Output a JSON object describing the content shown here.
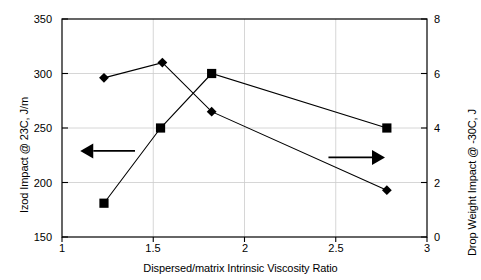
{
  "chart_data": {
    "type": "line",
    "title": "",
    "xlabel": "Dispersed/matrix Intrinsic Viscosity Ratio",
    "xlim": [
      1,
      3
    ],
    "xticks": [
      1,
      1.5,
      2,
      2.5,
      3
    ],
    "xtick_labels": [
      "1",
      "1.5",
      "2",
      "2.5",
      "3"
    ],
    "grid": true,
    "legend": "none",
    "y_left": {
      "label": "Izod Impact @ 23C, J/m",
      "lim": [
        150,
        350
      ],
      "ticks": [
        150,
        200,
        250,
        300,
        350
      ],
      "tick_labels": [
        "150",
        "200",
        "250",
        "300",
        "350"
      ]
    },
    "y_right": {
      "label": "Drop Weight Impact @ -30C, J",
      "lim": [
        0,
        8
      ],
      "ticks": [
        0,
        2,
        4,
        6,
        8
      ],
      "tick_labels": [
        "0",
        "2",
        "4",
        "6",
        "8"
      ]
    },
    "series": [
      {
        "name": "Izod Impact @ 23C, J/m",
        "axis": "left",
        "marker": "square",
        "x": [
          1.23,
          1.54,
          1.82,
          2.78
        ],
        "values": [
          181,
          250,
          300,
          250
        ]
      },
      {
        "name": "Drop Weight Impact @ -30C, J",
        "axis": "right",
        "marker": "diamond",
        "x": [
          1.23,
          1.55,
          1.82,
          2.78
        ],
        "values": [
          5.85,
          6.4,
          4.6,
          1.75
        ],
        "values_on_left_scale": [
          296,
          310,
          265,
          193
        ]
      }
    ],
    "annotations": [
      {
        "name": "left-axis-arrow",
        "icon": "arrow-left-icon",
        "points_to": "left",
        "x_start": 1.4,
        "x_end": 1.1,
        "y_left": 229
      },
      {
        "name": "right-axis-arrow",
        "icon": "arrow-right-icon",
        "points_to": "right",
        "x_start": 2.46,
        "x_end": 2.77,
        "y_left": 223
      }
    ],
    "colors": {
      "line": "#000000",
      "marker": "#000000",
      "grid": "#cccccc",
      "frame": "#000000",
      "background": "#ffffff",
      "annotation": "#000000"
    }
  }
}
